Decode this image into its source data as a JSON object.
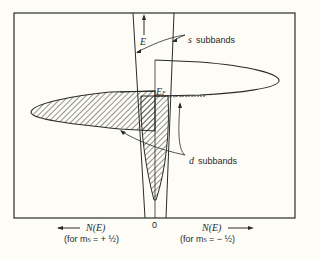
{
  "diagram": {
    "type": "density-of-states",
    "energy_axis_label": "E",
    "fermi_label": "E",
    "fermi_subscript": "F",
    "origin_label": "0",
    "annotations": {
      "s_label_prefix": "s",
      "s_label_suffix": "subbands",
      "d_label_prefix": "d",
      "d_label_suffix": "subbands"
    },
    "left_axis": {
      "arrow": "←",
      "label": "N(E)",
      "spin_caption": "(for m",
      "spin_sub": "S",
      "spin_value": "= + ½)"
    },
    "right_axis": {
      "arrow": "→",
      "label": "N(E)",
      "spin_caption": "(for m",
      "spin_sub": "S",
      "spin_value": "= − ½)"
    },
    "colors": {
      "line": "#2a2a2a",
      "background": "#fdfcf6"
    }
  }
}
